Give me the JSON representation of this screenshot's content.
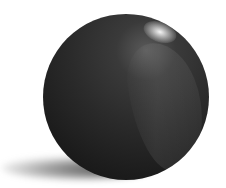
{
  "image": {
    "subject": "glossy black sphere",
    "background_color": "#ffffff",
    "sphere_color": "#2b2b2b",
    "highlight_color": "#ffffff",
    "shadow_color": "#1a1a1a"
  }
}
